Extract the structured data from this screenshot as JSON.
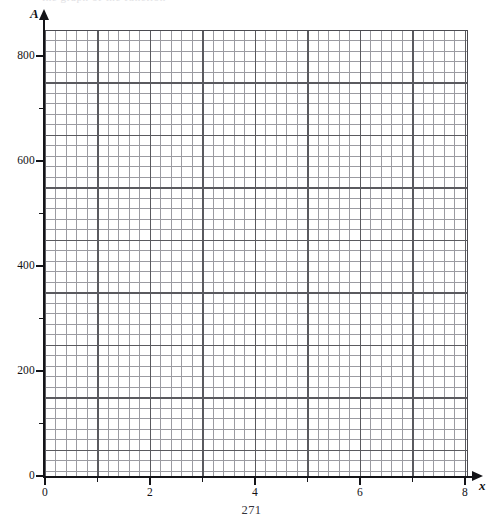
{
  "page": {
    "page_number": "271",
    "clipped_header_text": "the graph of the function"
  },
  "chart_data": {
    "type": "line",
    "title": "",
    "subtitle": "",
    "xlabel": "x",
    "ylabel": "A",
    "series": [],
    "x": [],
    "values": [],
    "annotations": [],
    "legend": [],
    "legend_position": "none",
    "grid": true,
    "grid_minor": true,
    "xlim": [
      0,
      8.05
    ],
    "ylim": [
      0,
      851
    ],
    "x_major_step": 1,
    "x_label_step": 2,
    "x_minor_step": 0.2,
    "y_major_step": 100,
    "y_label_step": 200,
    "y_minor_step": 20,
    "x_tick_labels": [
      "0",
      "2",
      "4",
      "6",
      "8"
    ],
    "x_tick_values": [
      0,
      2,
      4,
      6,
      8
    ],
    "x_minor_tick_values": [
      1,
      3,
      5,
      7
    ],
    "y_tick_labels": [
      "0",
      "200",
      "400",
      "600",
      "800"
    ],
    "y_tick_values": [
      0,
      200,
      400,
      600,
      800
    ],
    "y_minor_tick_values": [
      100,
      300,
      500,
      700
    ],
    "origin_label": "0",
    "note": "Blank graph paper: axes and gridlines only, no plotted data."
  },
  "axes": {
    "y_axis_name": "A",
    "x_axis_name": "x",
    "y_labels": [
      {
        "text": "800",
        "top": 49
      },
      {
        "text": "600",
        "top": 154
      },
      {
        "text": "400",
        "top": 259
      },
      {
        "text": "200",
        "top": 364
      },
      {
        "text": "0",
        "top": 469
      }
    ],
    "x_labels": [
      {
        "text": "0",
        "left": 45
      },
      {
        "text": "2",
        "left": 150
      },
      {
        "text": "4",
        "left": 255
      },
      {
        "text": "6",
        "left": 360
      },
      {
        "text": "8",
        "left": 465
      }
    ]
  },
  "colors": {
    "background": "#ffffff",
    "axis": "#141418",
    "grid_major": "#5a5a5f",
    "grid_minor": "#9b9ba1",
    "text": "#111115",
    "page_number": "#33333a"
  }
}
